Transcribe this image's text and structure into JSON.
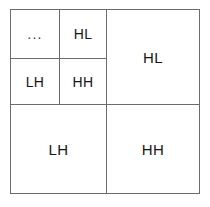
{
  "diagram": {
    "kind": "wavelet-subband-decomposition",
    "levels": 2,
    "line_color": "#6b6b6b",
    "background_color": "#ffffff",
    "text_color": "#161616",
    "quadrants": [
      {
        "id": "ll",
        "position": "top-left",
        "label": "",
        "subdivided": true,
        "subquadrants": [
          {
            "id": "ll-ll",
            "position": "top-left",
            "label": "..."
          },
          {
            "id": "ll-hl",
            "position": "top-right",
            "label": "HL"
          },
          {
            "id": "ll-lh",
            "position": "bottom-left",
            "label": "LH"
          },
          {
            "id": "ll-hh",
            "position": "bottom-right",
            "label": "HH"
          }
        ]
      },
      {
        "id": "hl",
        "position": "top-right",
        "label": "HL",
        "subdivided": false
      },
      {
        "id": "lh",
        "position": "bottom-left",
        "label": "LH",
        "subdivided": false
      },
      {
        "id": "hh",
        "position": "bottom-right",
        "label": "HH",
        "subdivided": false
      }
    ]
  }
}
